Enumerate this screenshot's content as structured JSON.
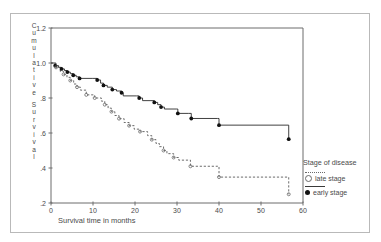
{
  "figure": {
    "border_color": "#b9b9b9"
  },
  "axes": {
    "y": {
      "title_letters": [
        "C",
        "u",
        "m",
        "u",
        "l",
        "a",
        "t",
        "i",
        "v",
        "e",
        "S",
        "u",
        "r",
        "v",
        "i",
        "v",
        "a",
        "l"
      ],
      "title_text": "Cumulative Survival",
      "ticks": [
        "1.2",
        "1.0",
        ".8",
        ".6",
        ".4",
        ".2"
      ],
      "tick_values": [
        1.2,
        1.0,
        0.8,
        0.6,
        0.4,
        0.2
      ],
      "min": 0.2,
      "max": 1.2
    },
    "x": {
      "title_text": "Survival time in months",
      "ticks": [
        "0",
        "10",
        "20",
        "30",
        "40",
        "50",
        "60"
      ],
      "tick_values": [
        0,
        10,
        20,
        30,
        40,
        50,
        60
      ],
      "min": 0,
      "max": 60
    }
  },
  "legend": {
    "title": "Stage of disease",
    "items": [
      {
        "label": "late stage",
        "marker": "open-circle",
        "line": "dotted",
        "color": "#6a6a6a"
      },
      {
        "label": "early stage",
        "marker": "filled-circle",
        "line": "solid",
        "color": "#111111"
      }
    ]
  },
  "chart_data": {
    "type": "line",
    "subtype": "kaplan-meier-step",
    "title": "",
    "xlabel": "Survival time in months",
    "ylabel": "Cumulative Survival",
    "xlim": [
      0,
      60
    ],
    "ylim": [
      0.2,
      1.2
    ],
    "grid": false,
    "legend_position": "right",
    "legend_title": "Stage of disease",
    "series": [
      {
        "name": "early stage",
        "style": "solid",
        "marker": "filled-circle",
        "color": "#111111",
        "points": [
          [
            0.0,
            1.0
          ],
          [
            1.0,
            0.985
          ],
          [
            1.8,
            0.975
          ],
          [
            2.5,
            0.966
          ],
          [
            3.2,
            0.957
          ],
          [
            3.9,
            0.948
          ],
          [
            4.6,
            0.939
          ],
          [
            5.3,
            0.93
          ],
          [
            6.0,
            0.921
          ],
          [
            6.8,
            0.912
          ],
          [
            9.8,
            0.912
          ],
          [
            11.0,
            0.903
          ],
          [
            11.8,
            0.885
          ],
          [
            12.5,
            0.872
          ],
          [
            13.4,
            0.862
          ],
          [
            14.6,
            0.848
          ],
          [
            15.6,
            0.84
          ],
          [
            16.8,
            0.83
          ],
          [
            17.2,
            0.812
          ],
          [
            20.4,
            0.812
          ],
          [
            21.0,
            0.8
          ],
          [
            21.8,
            0.785
          ],
          [
            23.8,
            0.785
          ],
          [
            24.6,
            0.775
          ],
          [
            25.4,
            0.762
          ],
          [
            26.2,
            0.748
          ],
          [
            27.0,
            0.737
          ],
          [
            29.8,
            0.737
          ],
          [
            30.2,
            0.712
          ],
          [
            32.8,
            0.712
          ],
          [
            33.4,
            0.683
          ],
          [
            39.6,
            0.683
          ],
          [
            40.0,
            0.645
          ],
          [
            56.2,
            0.645
          ],
          [
            56.6,
            0.565
          ]
        ],
        "censor_marks": [
          [
            1.0,
            0.985
          ],
          [
            2.5,
            0.966
          ],
          [
            3.9,
            0.948
          ],
          [
            5.3,
            0.93
          ],
          [
            6.8,
            0.912
          ],
          [
            11.0,
            0.903
          ],
          [
            12.5,
            0.872
          ],
          [
            14.6,
            0.848
          ],
          [
            16.8,
            0.83
          ],
          [
            21.0,
            0.8
          ],
          [
            24.6,
            0.775
          ],
          [
            26.2,
            0.748
          ],
          [
            30.2,
            0.712
          ],
          [
            33.4,
            0.683
          ],
          [
            40.0,
            0.645
          ],
          [
            56.6,
            0.565
          ]
        ]
      },
      {
        "name": "late stage",
        "style": "dotted",
        "marker": "open-circle",
        "color": "#6a6a6a",
        "points": [
          [
            0.0,
            1.0
          ],
          [
            1.2,
            0.975
          ],
          [
            2.2,
            0.952
          ],
          [
            3.0,
            0.935
          ],
          [
            3.8,
            0.918
          ],
          [
            4.6,
            0.9
          ],
          [
            5.4,
            0.88
          ],
          [
            6.2,
            0.862
          ],
          [
            7.0,
            0.845
          ],
          [
            8.4,
            0.818
          ],
          [
            10.4,
            0.8
          ],
          [
            12.0,
            0.782
          ],
          [
            12.8,
            0.762
          ],
          [
            13.6,
            0.742
          ],
          [
            14.4,
            0.722
          ],
          [
            15.2,
            0.7
          ],
          [
            16.2,
            0.682
          ],
          [
            17.4,
            0.66
          ],
          [
            18.6,
            0.642
          ],
          [
            19.8,
            0.622
          ],
          [
            21.2,
            0.608
          ],
          [
            22.4,
            0.608
          ],
          [
            23.0,
            0.585
          ],
          [
            24.0,
            0.562
          ],
          [
            25.0,
            0.54
          ],
          [
            25.8,
            0.522
          ],
          [
            26.8,
            0.5
          ],
          [
            27.6,
            0.482
          ],
          [
            29.2,
            0.46
          ],
          [
            30.4,
            0.445
          ],
          [
            32.6,
            0.445
          ],
          [
            33.2,
            0.41
          ],
          [
            39.6,
            0.41
          ],
          [
            40.0,
            0.348
          ],
          [
            56.2,
            0.348
          ],
          [
            56.6,
            0.25
          ]
        ],
        "censor_marks": [
          [
            1.2,
            0.975
          ],
          [
            3.0,
            0.935
          ],
          [
            4.6,
            0.9
          ],
          [
            6.2,
            0.862
          ],
          [
            8.4,
            0.818
          ],
          [
            10.4,
            0.8
          ],
          [
            12.8,
            0.762
          ],
          [
            14.4,
            0.722
          ],
          [
            16.2,
            0.682
          ],
          [
            18.6,
            0.642
          ],
          [
            21.2,
            0.608
          ],
          [
            24.0,
            0.562
          ],
          [
            26.8,
            0.5
          ],
          [
            29.2,
            0.46
          ],
          [
            33.2,
            0.41
          ],
          [
            40.0,
            0.348
          ],
          [
            56.6,
            0.25
          ]
        ]
      }
    ]
  }
}
